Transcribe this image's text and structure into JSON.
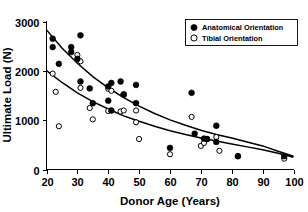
{
  "chart_data": {
    "type": "scatter",
    "title": "",
    "xlabel": "Donor Age (Years)",
    "ylabel": "Ultimate Load (N)",
    "xlim": [
      20,
      100
    ],
    "ylim": [
      0,
      3000
    ],
    "xticks": [
      20,
      30,
      40,
      50,
      60,
      70,
      80,
      90,
      100
    ],
    "yticks": [
      0,
      1000,
      2000,
      3000
    ],
    "xtick_labels": [
      "20",
      "30",
      "40",
      "50",
      "60",
      "70",
      "80",
      "90",
      "100"
    ],
    "ytick_labels": [
      "0",
      "1000",
      "2000",
      "3000"
    ],
    "grid": false,
    "legend_position": "top-right",
    "series": [
      {
        "name": "Anatomical Orientation",
        "marker": "filled-circle",
        "color": "#000000",
        "points": [
          [
            22,
            2660
          ],
          [
            22,
            2490
          ],
          [
            24,
            2150
          ],
          [
            28,
            2490
          ],
          [
            28,
            2390
          ],
          [
            30,
            2250
          ],
          [
            31,
            2730
          ],
          [
            31,
            1790
          ],
          [
            34,
            1650
          ],
          [
            35,
            1350
          ],
          [
            40,
            1400
          ],
          [
            40,
            1690
          ],
          [
            41,
            1760
          ],
          [
            41,
            1200
          ],
          [
            44,
            1790
          ],
          [
            45,
            1530
          ],
          [
            45,
            1520
          ],
          [
            49,
            1720
          ],
          [
            49,
            1350
          ],
          [
            60,
            440
          ],
          [
            67,
            1560
          ],
          [
            68,
            730
          ],
          [
            71,
            630
          ],
          [
            72,
            620
          ],
          [
            75,
            890
          ],
          [
            75,
            560
          ],
          [
            82,
            270
          ],
          [
            97,
            270
          ]
        ]
      },
      {
        "name": "Tibial Orientation",
        "marker": "open-circle",
        "color": "#000000",
        "points": [
          [
            22,
            1950
          ],
          [
            23,
            1580
          ],
          [
            24,
            880
          ],
          [
            30,
            2330
          ],
          [
            31,
            2200
          ],
          [
            31,
            1660
          ],
          [
            34,
            1250
          ],
          [
            35,
            1020
          ],
          [
            40,
            1640
          ],
          [
            40,
            1190
          ],
          [
            41,
            1600
          ],
          [
            44,
            1180
          ],
          [
            45,
            1200
          ],
          [
            49,
            1200
          ],
          [
            49,
            960
          ],
          [
            50,
            620
          ],
          [
            60,
            310
          ],
          [
            67,
            1070
          ],
          [
            70,
            480
          ],
          [
            71,
            540
          ],
          [
            72,
            620
          ],
          [
            75,
            660
          ],
          [
            76,
            380
          ],
          [
            82,
            270
          ],
          [
            97,
            220
          ]
        ]
      }
    ],
    "fit_curves": [
      {
        "name": "Anatomical Orientation fit",
        "type": "exponential-decay",
        "points": [
          [
            20,
            2840
          ],
          [
            25,
            2470
          ],
          [
            30,
            2160
          ],
          [
            35,
            1890
          ],
          [
            40,
            1660
          ],
          [
            45,
            1460
          ],
          [
            50,
            1290
          ],
          [
            55,
            1140
          ],
          [
            60,
            1010
          ],
          [
            65,
            900
          ],
          [
            70,
            800
          ],
          [
            75,
            710
          ],
          [
            80,
            640
          ],
          [
            85,
            560
          ],
          [
            90,
            480
          ],
          [
            95,
            370
          ],
          [
            100,
            270
          ]
        ]
      },
      {
        "name": "Tibial Orientation fit",
        "type": "exponential-decay",
        "points": [
          [
            20,
            2010
          ],
          [
            25,
            1770
          ],
          [
            30,
            1560
          ],
          [
            35,
            1380
          ],
          [
            40,
            1230
          ],
          [
            45,
            1090
          ],
          [
            50,
            980
          ],
          [
            55,
            880
          ],
          [
            60,
            790
          ],
          [
            65,
            710
          ],
          [
            70,
            640
          ],
          [
            75,
            580
          ],
          [
            80,
            520
          ],
          [
            85,
            460
          ],
          [
            90,
            400
          ],
          [
            95,
            330
          ],
          [
            100,
            250
          ]
        ]
      }
    ]
  },
  "legend": {
    "items": [
      {
        "label": "Anatomical Orientation",
        "marker": "filled-circle"
      },
      {
        "label": "Tibial Orientation",
        "marker": "open-circle"
      }
    ]
  },
  "axes": {
    "x_title": "Donor Age (Years)",
    "y_title": "Ultimate Load (N)"
  }
}
